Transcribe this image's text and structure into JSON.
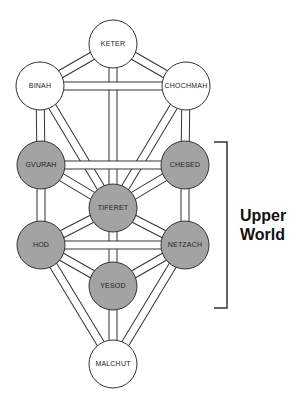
{
  "diagram": {
    "colors": {
      "filled": "#a3a3a3",
      "empty": "#ffffff",
      "stroke": "#333333"
    },
    "nodes": [
      {
        "id": "keter",
        "label": "KETER",
        "x": 113,
        "y": 44,
        "filled": false
      },
      {
        "id": "binah",
        "label": "BINAH",
        "x": 40,
        "y": 86,
        "filled": false
      },
      {
        "id": "chochmah",
        "label": "CHOCHMAH",
        "x": 186,
        "y": 86,
        "filled": false
      },
      {
        "id": "gvurah",
        "label": "GVURAH",
        "x": 41,
        "y": 165,
        "filled": true
      },
      {
        "id": "chesed",
        "label": "CHESED",
        "x": 185,
        "y": 165,
        "filled": true
      },
      {
        "id": "tiferet",
        "label": "TIFERET",
        "x": 113,
        "y": 208,
        "filled": true
      },
      {
        "id": "hod",
        "label": "HOD",
        "x": 41,
        "y": 245,
        "filled": true
      },
      {
        "id": "netzach",
        "label": "NETZACH",
        "x": 185,
        "y": 245,
        "filled": true
      },
      {
        "id": "yesod",
        "label": "YESOD",
        "x": 113,
        "y": 286,
        "filled": true
      },
      {
        "id": "malchut",
        "label": "MALCHUT",
        "x": 113,
        "y": 364,
        "filled": false
      }
    ],
    "bracket_label_line1": "Upper",
    "bracket_label_line2": "World"
  }
}
